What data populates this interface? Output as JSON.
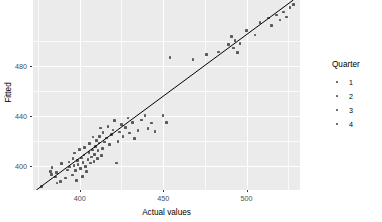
{
  "chart_data": {
    "type": "scatter",
    "title": "",
    "xlabel": "Actual values",
    "ylabel": "Fitted",
    "xlim": [
      372,
      532
    ],
    "ylim": [
      381,
      533
    ],
    "xticks": [
      400,
      450,
      500
    ],
    "xticklabels": [
      "400",
      "450",
      "500"
    ],
    "yticks": [
      400,
      440,
      480
    ],
    "yticklabels": [
      "400",
      "440",
      "480"
    ],
    "grid": true,
    "legend": {
      "title": "Quarter",
      "position": "right",
      "entries": [
        {
          "label": "1",
          "color": "#595959"
        },
        {
          "label": "2",
          "color": "#595959"
        },
        {
          "label": "3",
          "color": "#595959"
        },
        {
          "label": "4",
          "color": "#595959"
        }
      ]
    },
    "reference_line": {
      "type": "identity-fit",
      "x": [
        374,
        528
      ],
      "y": [
        381,
        533
      ],
      "color": "#000000",
      "width": 1
    },
    "point_color": "#595959",
    "series": [
      {
        "name": "points",
        "x": [
          377.0,
          382.5,
          383.0,
          383.5,
          385.5,
          386.0,
          386.5,
          388.5,
          389.0,
          391.5,
          392.5,
          393.5,
          394.0,
          395.5,
          396.0,
          396.5,
          397.0,
          397.5,
          398.0,
          398.5,
          399.0,
          400.0,
          400.5,
          401.0,
          401.5,
          402.0,
          402.5,
          403.0,
          403.5,
          404.0,
          405.0,
          405.5,
          406.0,
          406.5,
          407.0,
          407.5,
          408.0,
          408.5,
          409.0,
          409.5,
          410.0,
          410.5,
          411.0,
          411.5,
          412.0,
          412.5,
          413.0,
          413.5,
          414.0,
          415.0,
          416.0,
          417.0,
          418.0,
          419.0,
          420.0,
          421.0,
          422.0,
          423.0,
          424.0,
          425.0,
          426.0,
          427.5,
          429.0,
          430.0,
          431.5,
          433.0,
          435.0,
          437.0,
          439.0,
          441.0,
          443.0,
          445.0,
          450.0,
          452.0,
          454.0,
          468.0,
          476.0,
          483.0,
          489.0,
          491.0,
          492.0,
          493.0,
          494.5,
          496.0,
          500.0,
          505.0,
          508.0,
          513.0,
          515.0,
          518.0,
          520.0,
          522.0,
          524.0,
          526.0,
          528.0
        ],
        "y": [
          384.0,
          396.0,
          393.5,
          399.0,
          391.5,
          395.0,
          386.5,
          388.0,
          402.0,
          390.5,
          397.0,
          403.5,
          399.5,
          393.0,
          406.0,
          400.5,
          410.5,
          396.5,
          388.5,
          404.5,
          401.5,
          413.5,
          398.0,
          406.5,
          392.0,
          403.0,
          409.0,
          415.0,
          400.0,
          396.0,
          405.5,
          411.0,
          418.0,
          402.5,
          407.5,
          413.0,
          423.5,
          404.0,
          409.5,
          416.0,
          420.5,
          406.0,
          412.5,
          418.5,
          424.0,
          430.5,
          408.5,
          414.0,
          427.0,
          419.5,
          422.5,
          432.0,
          417.5,
          425.5,
          429.0,
          436.5,
          402.5,
          420.0,
          427.5,
          433.5,
          424.0,
          431.0,
          438.5,
          426.5,
          435.0,
          422.0,
          428.5,
          437.0,
          440.5,
          430.0,
          434.5,
          428.0,
          440.5,
          435.0,
          487.0,
          485.5,
          489.5,
          491.5,
          497.5,
          504.0,
          494.5,
          500.5,
          491.0,
          498.0,
          508.5,
          505.0,
          515.0,
          518.5,
          512.5,
          521.0,
          517.0,
          523.5,
          519.5,
          527.0,
          529.5
        ]
      }
    ]
  },
  "axes": {
    "x_title": "Actual values",
    "y_title": "Fitted"
  }
}
